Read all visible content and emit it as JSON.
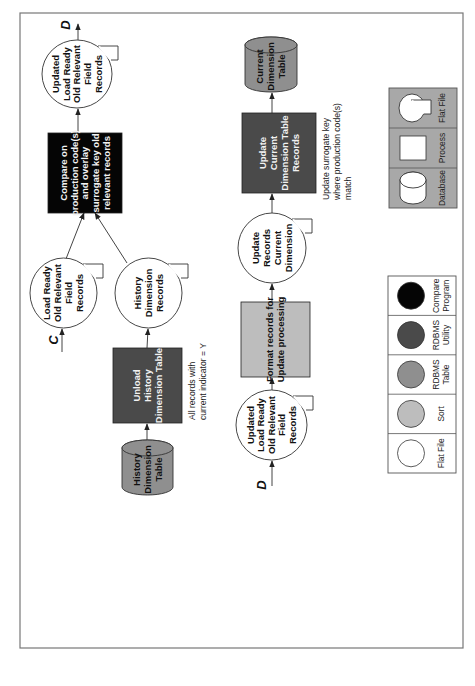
{
  "diagram": {
    "colors": {
      "flat_file": "#ffffff",
      "sort": "#bdbdbd",
      "rdbms_table": "#8f8f8f",
      "rdbms_utility": "#4a4a4a",
      "compare_program": "#050505",
      "legend_process_bg": "#a8a8a8",
      "frame": "#777777"
    },
    "nodes": {
      "history_dimension_table": {
        "type": "rdbms-table",
        "lines": [
          "History",
          "Dimension",
          "Table"
        ]
      },
      "unload_history": {
        "type": "rdbms-utility",
        "lines": [
          "Unload",
          "History",
          "Dimension Table"
        ]
      },
      "unload_note": {
        "lines": [
          "All records with",
          "current indicator = Y"
        ]
      },
      "load_ready_old": {
        "type": "flat-file",
        "lines": [
          "Load Ready",
          "Old Relevant",
          "Field",
          "Records"
        ]
      },
      "history_dimension_records": {
        "type": "flat-file",
        "lines": [
          "History",
          "Dimension",
          "Records"
        ]
      },
      "compare_program": {
        "type": "compare-program",
        "lines": [
          "Compare on",
          "production code(s)",
          "and overlay",
          "surrogate key old",
          "relevant records"
        ]
      },
      "updated_load_ready_top": {
        "type": "flat-file",
        "lines": [
          "Updated",
          "Load Ready",
          "Old Relevant",
          "Field",
          "Records"
        ]
      },
      "updated_load_ready_bottom": {
        "type": "flat-file",
        "lines": [
          "Updated",
          "Load Ready",
          "Old Relevant",
          "Field",
          "Records"
        ]
      },
      "format_records": {
        "type": "sort",
        "lines": [
          "Format records for",
          "Update processing"
        ]
      },
      "update_records_current": {
        "type": "flat-file",
        "lines": [
          "Update",
          "Records",
          "Current",
          "Dimension"
        ]
      },
      "update_current_table": {
        "type": "rdbms-utility",
        "lines": [
          "Update",
          "Current",
          "Dimension Table",
          "Records"
        ]
      },
      "update_note": {
        "lines": [
          "Update surrogate key",
          "where production code(s)",
          "match"
        ]
      },
      "current_dimension_table": {
        "type": "rdbms-table",
        "lines": [
          "Current",
          "Dimension",
          "Table"
        ]
      }
    },
    "connectors": {
      "c_in": "C",
      "d_out": "D",
      "d_in": "D"
    },
    "edges": [
      {
        "from": "history_dimension_table",
        "to": "unload_history"
      },
      {
        "from": "unload_history",
        "to": "history_dimension_records"
      },
      {
        "from": "connector-C",
        "to": "load_ready_old"
      },
      {
        "from": "load_ready_old",
        "to": "compare_program"
      },
      {
        "from": "history_dimension_records",
        "to": "compare_program"
      },
      {
        "from": "compare_program",
        "to": "updated_load_ready_top"
      },
      {
        "from": "updated_load_ready_top",
        "to": "connector-D"
      },
      {
        "from": "connector-D",
        "to": "updated_load_ready_bottom"
      },
      {
        "from": "updated_load_ready_bottom",
        "to": "format_records"
      },
      {
        "from": "format_records",
        "to": "update_records_current"
      },
      {
        "from": "update_records_current",
        "to": "update_current_table"
      },
      {
        "from": "update_current_table",
        "to": "current_dimension_table"
      }
    ],
    "legend_symbols": [
      {
        "name": "flat-file",
        "label": "Flat File"
      },
      {
        "name": "sort",
        "label": "Sort"
      },
      {
        "name": "rdbms-table",
        "label": [
          "RDBMS",
          "Table"
        ]
      },
      {
        "name": "rdbms-utility",
        "label": [
          "RDBMS",
          "Utility"
        ]
      },
      {
        "name": "compare-program",
        "label": [
          "Compare",
          "Program"
        ]
      }
    ],
    "legend_shapes": [
      {
        "name": "database",
        "label": "Database"
      },
      {
        "name": "process",
        "label": "Process"
      },
      {
        "name": "flat-file",
        "label": "Flat File"
      }
    ]
  }
}
